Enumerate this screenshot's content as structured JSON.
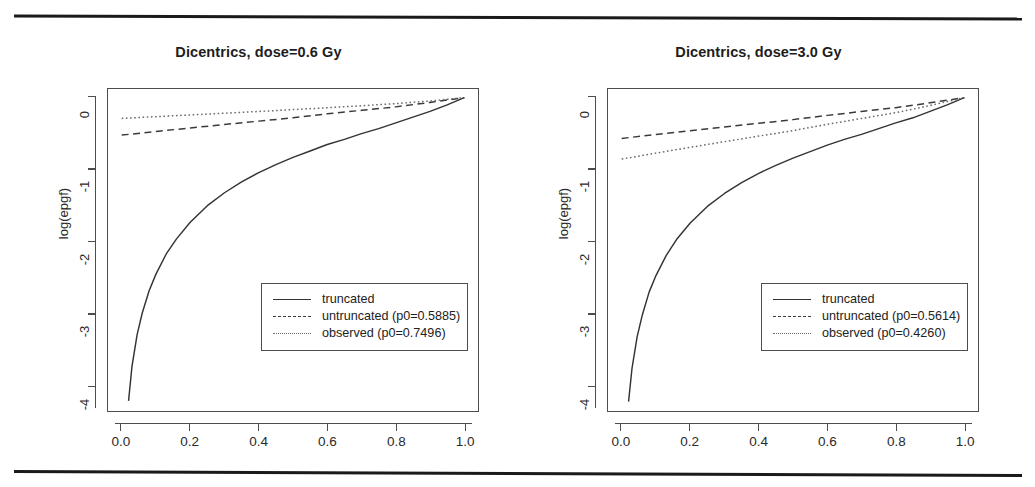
{
  "figure": {
    "background": "#ffffff",
    "rule_color": "#1a1a1a"
  },
  "chart_data": [
    {
      "type": "line",
      "title": "Dicentrics, dose=0.6 Gy",
      "xlabel": "",
      "ylabel": "log(epgf)",
      "xlim": [
        -0.04,
        1.04
      ],
      "ylim": [
        -4.35,
        0.12
      ],
      "xticks": [
        "0.0",
        "0.2",
        "0.4",
        "0.6",
        "0.8",
        "1.0"
      ],
      "xtick_values": [
        0.0,
        0.2,
        0.4,
        0.6,
        0.8,
        1.0
      ],
      "yticks": [
        "0",
        "-1",
        "-2",
        "-3",
        "-4"
      ],
      "ytick_values": [
        0,
        -1,
        -2,
        -3,
        -4
      ],
      "grid": false,
      "legend_position": "bottom-right",
      "series": [
        {
          "name": "truncated",
          "style": "solid",
          "color": "#333333",
          "x": [
            0.02,
            0.03,
            0.045,
            0.06,
            0.08,
            0.1,
            0.13,
            0.16,
            0.2,
            0.25,
            0.3,
            0.35,
            0.4,
            0.45,
            0.5,
            0.55,
            0.6,
            0.65,
            0.7,
            0.75,
            0.8,
            0.85,
            0.9,
            0.95,
            1.0
          ],
          "y": [
            -4.21,
            -3.73,
            -3.29,
            -2.99,
            -2.68,
            -2.45,
            -2.17,
            -1.96,
            -1.73,
            -1.5,
            -1.32,
            -1.17,
            -1.04,
            -0.93,
            -0.83,
            -0.74,
            -0.65,
            -0.58,
            -0.5,
            -0.43,
            -0.35,
            -0.27,
            -0.19,
            -0.1,
            0.0
          ]
        },
        {
          "name": "untruncated (p0=0.5885)",
          "style": "dashed",
          "color": "#3a3a3a",
          "p0": 0.5885,
          "x": [
            0.0,
            0.1,
            0.2,
            0.3,
            0.4,
            0.5,
            0.6,
            0.7,
            0.8,
            0.9,
            1.0
          ],
          "y": [
            -0.52,
            -0.47,
            -0.421,
            -0.373,
            -0.326,
            -0.28,
            -0.225,
            -0.176,
            -0.128,
            -0.066,
            0.0
          ]
        },
        {
          "name": "observed (p0=0.7496)",
          "style": "dotted",
          "color": "#6a6a6a",
          "p0": 0.7496,
          "x": [
            0.0,
            0.1,
            0.2,
            0.3,
            0.4,
            0.5,
            0.6,
            0.7,
            0.8,
            0.9,
            1.0
          ],
          "y": [
            -0.288,
            -0.264,
            -0.24,
            -0.216,
            -0.192,
            -0.166,
            -0.14,
            -0.113,
            -0.083,
            -0.046,
            0.0
          ]
        }
      ]
    },
    {
      "type": "line",
      "title": "Dicentrics, dose=3.0 Gy",
      "xlabel": "",
      "ylabel": "log(epgf)",
      "xlim": [
        -0.04,
        1.04
      ],
      "ylim": [
        -4.35,
        0.12
      ],
      "xticks": [
        "0.0",
        "0.2",
        "0.4",
        "0.6",
        "0.8",
        "1.0"
      ],
      "xtick_values": [
        0.0,
        0.2,
        0.4,
        0.6,
        0.8,
        1.0
      ],
      "yticks": [
        "0",
        "-1",
        "-2",
        "-3",
        "-4"
      ],
      "ytick_values": [
        0,
        -1,
        -2,
        -3,
        -4
      ],
      "grid": false,
      "legend_position": "bottom-right",
      "series": [
        {
          "name": "truncated",
          "style": "solid",
          "color": "#333333",
          "x": [
            0.02,
            0.03,
            0.045,
            0.06,
            0.08,
            0.1,
            0.13,
            0.16,
            0.2,
            0.25,
            0.3,
            0.35,
            0.4,
            0.45,
            0.5,
            0.55,
            0.6,
            0.65,
            0.7,
            0.75,
            0.8,
            0.85,
            0.9,
            0.95,
            1.0
          ],
          "y": [
            -4.22,
            -3.76,
            -3.32,
            -3.02,
            -2.7,
            -2.47,
            -2.19,
            -1.97,
            -1.74,
            -1.51,
            -1.33,
            -1.18,
            -1.05,
            -0.94,
            -0.84,
            -0.75,
            -0.66,
            -0.58,
            -0.51,
            -0.43,
            -0.35,
            -0.28,
            -0.19,
            -0.1,
            0.0
          ]
        },
        {
          "name": "untruncated (p0=0.5614)",
          "style": "dashed",
          "color": "#3a3a3a",
          "p0": 0.5614,
          "x": [
            0.0,
            0.1,
            0.2,
            0.3,
            0.4,
            0.5,
            0.6,
            0.7,
            0.8,
            0.9,
            1.0
          ],
          "y": [
            -0.566,
            -0.512,
            -0.459,
            -0.407,
            -0.356,
            -0.305,
            -0.246,
            -0.192,
            -0.139,
            -0.072,
            0.0
          ]
        },
        {
          "name": "observed (p0=0.4260)",
          "style": "dotted",
          "color": "#6a6a6a",
          "p0": 0.426,
          "x": [
            0.0,
            0.1,
            0.2,
            0.3,
            0.4,
            0.5,
            0.6,
            0.7,
            0.8,
            0.9,
            1.0
          ],
          "y": [
            -0.853,
            -0.77,
            -0.69,
            -0.611,
            -0.534,
            -0.458,
            -0.371,
            -0.289,
            -0.209,
            -0.109,
            0.0
          ]
        }
      ]
    }
  ]
}
